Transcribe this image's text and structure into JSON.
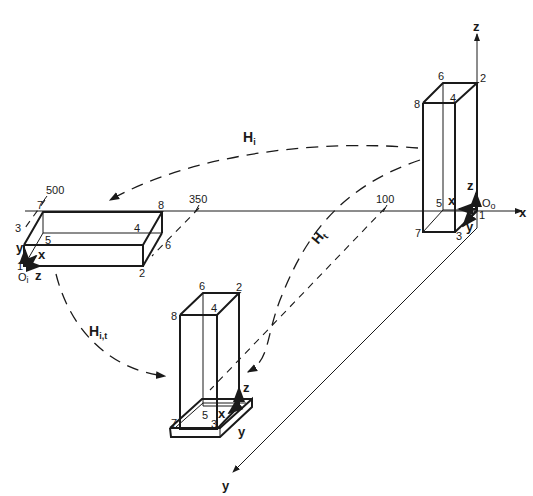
{
  "diagram": {
    "title": "",
    "global_axes": {
      "x": "x",
      "y": "y",
      "z": "z"
    },
    "origin_labels": {
      "left_block": "O",
      "left_block_sub": "i",
      "right_block": "O",
      "right_block_sub": "o"
    },
    "transform_labels": {
      "h_i": {
        "main": "H",
        "sub": "i"
      },
      "h_t": {
        "main": "H",
        "sub": "t"
      },
      "h_it": {
        "main": "H",
        "sub": "i,t"
      }
    },
    "dimensions": [
      "500",
      "350",
      "100"
    ],
    "left_block": {
      "vertices": [
        "1",
        "2",
        "3",
        "4",
        "5",
        "6",
        "7",
        "8"
      ],
      "local_axes": [
        "y",
        "x",
        "z"
      ]
    },
    "right_block": {
      "vertices": [
        "1",
        "2",
        "3",
        "4",
        "5",
        "6",
        "7",
        "8"
      ],
      "local_axes": [
        "z",
        "x",
        "y"
      ]
    },
    "bottom_block": {
      "vertices": [
        "2",
        "3",
        "4",
        "5",
        "6",
        "7",
        "8"
      ],
      "local_axes": [
        "z",
        "x",
        "y"
      ]
    },
    "colors": {
      "ink": "#1a1a1a",
      "background": "#ffffff"
    }
  }
}
